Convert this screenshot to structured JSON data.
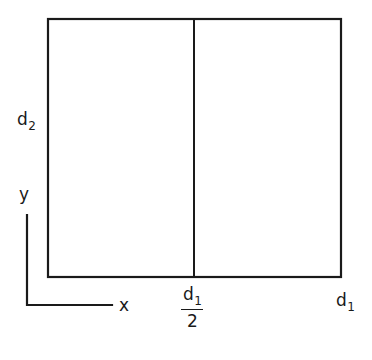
{
  "diagram": {
    "background_color": "#ffffff",
    "stroke_color": "#1a1a1a",
    "labels": {
      "height_dimension": "d",
      "height_subscript": "2",
      "width_dimension": "d",
      "width_subscript": "1",
      "half_width_numerator": "d",
      "half_width_numerator_subscript": "1",
      "half_width_denominator": "2",
      "axis_x": "x",
      "axis_y": "y"
    },
    "geometry": {
      "rect_left": 48,
      "rect_top": 19,
      "rect_right": 341,
      "rect_bottom": 277,
      "divider_x": 194,
      "axis_corner_x": 27,
      "axis_corner_y": 305,
      "axis_vertical_top": 215,
      "axis_horizontal_right": 112
    }
  }
}
